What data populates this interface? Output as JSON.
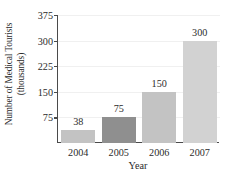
{
  "chart_data": {
    "type": "bar",
    "title": "",
    "subtitle": "",
    "xlabel": "Year",
    "ylabel": "Number of Medical Tourists (thousands)",
    "ylabel_line1": "Number of Medical Tourists",
    "ylabel_line2": "(thousands)",
    "categories": [
      "2004",
      "2005",
      "2006",
      "2007"
    ],
    "values": [
      38,
      75,
      150,
      300
    ],
    "value_labels": [
      "38",
      "75",
      "150",
      "300"
    ],
    "ylim": [
      0,
      375
    ],
    "xlim_note": "categorical",
    "yticks": [
      75,
      150,
      225,
      300,
      375
    ],
    "ytick_labels": [
      "75",
      "150",
      "225",
      "300",
      "375"
    ],
    "grid": "faint-horizontal",
    "legend": "none",
    "bar_colors": [
      "#c3c3c3",
      "#8f8f8f",
      "#c3c3c3",
      "#d2d2d2"
    ],
    "axis_color": "#4a4a4a",
    "background": "#ffffff"
  },
  "axis": {
    "y_title_line1": "Number of Medical Tourists",
    "y_title_line2": "(thousands)",
    "x_title": "Year"
  },
  "ticks": {
    "y": [
      {
        "label": "375",
        "value": 375
      },
      {
        "label": "300",
        "value": 300
      },
      {
        "label": "225",
        "value": 225
      },
      {
        "label": "150",
        "value": 150
      },
      {
        "label": "75",
        "value": 75
      }
    ],
    "x": [
      {
        "label": "2004"
      },
      {
        "label": "2005"
      },
      {
        "label": "2006"
      },
      {
        "label": "2007"
      }
    ]
  },
  "bars": [
    {
      "category": "2004",
      "value": 38,
      "label": "38",
      "color": "#c3c3c3"
    },
    {
      "category": "2005",
      "value": 75,
      "label": "75",
      "color": "#8f8f8f"
    },
    {
      "category": "2006",
      "value": 150,
      "label": "150",
      "color": "#c3c3c3"
    },
    {
      "category": "2007",
      "value": 300,
      "label": "300",
      "color": "#d2d2d2"
    }
  ]
}
